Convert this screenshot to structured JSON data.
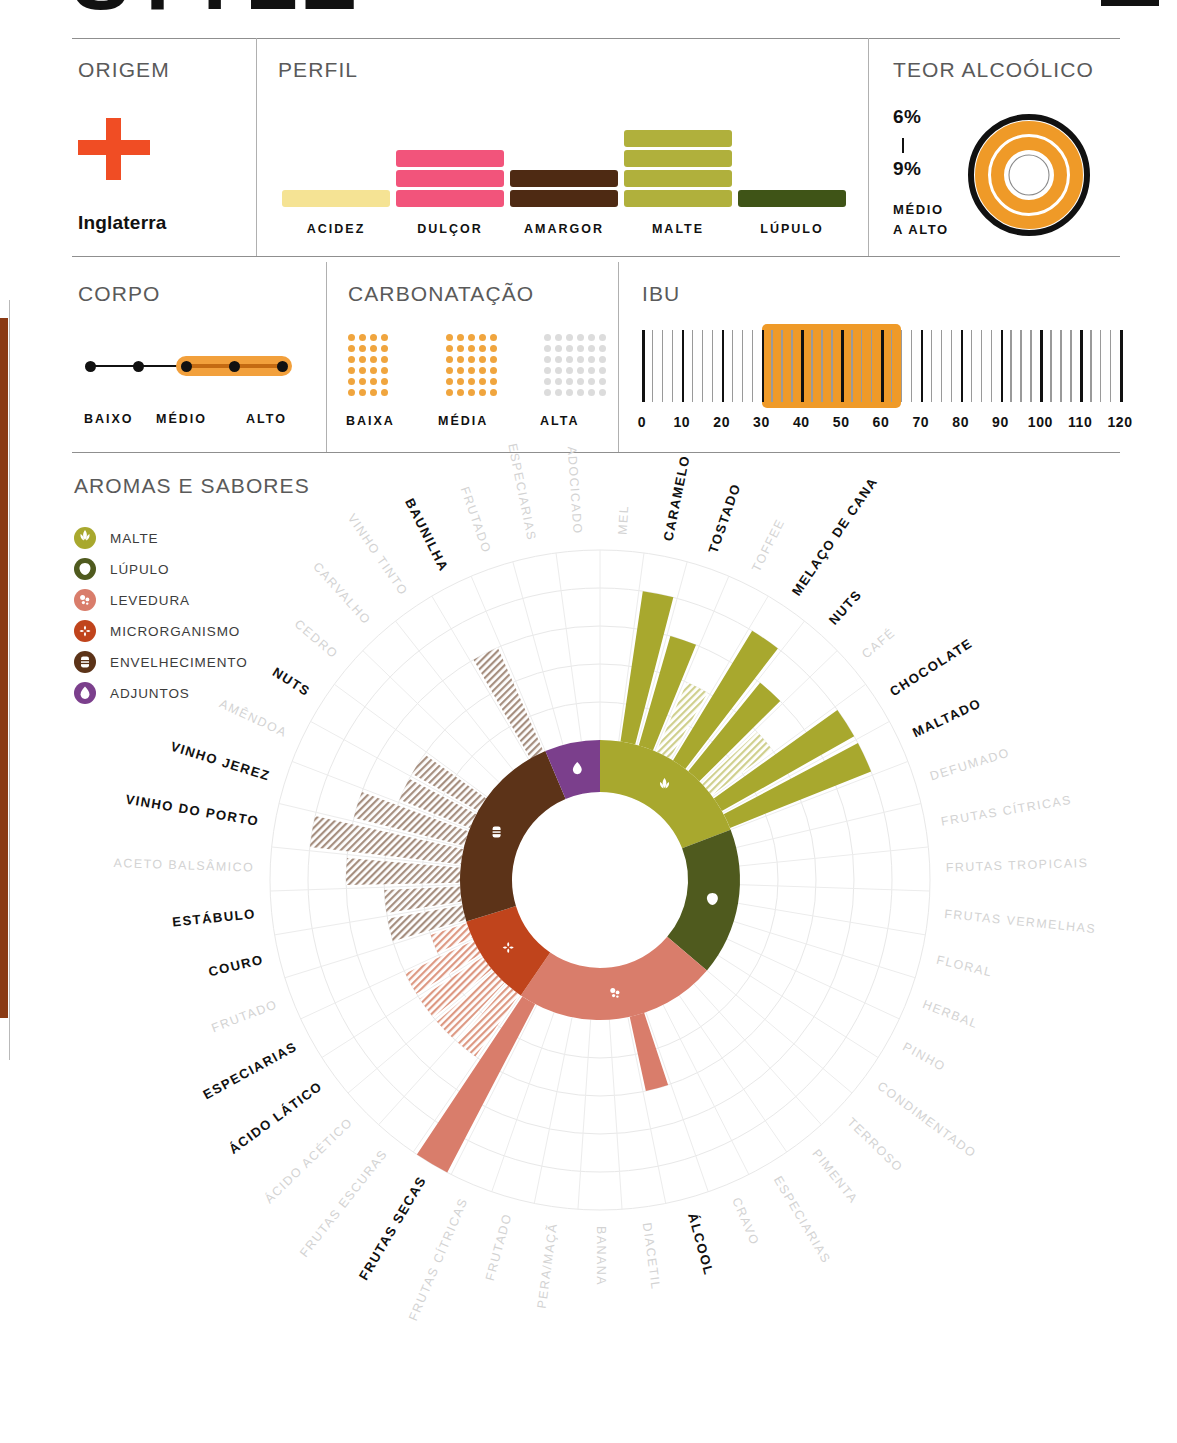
{
  "header": {
    "title_fragment": "STYLE",
    "corner_mark": "block"
  },
  "origem": {
    "heading": "ORIGEM",
    "country": "Inglaterra",
    "flag_icon": "england-cross-flag",
    "flag_color": "#f04d24"
  },
  "perfil": {
    "heading": "PERFIL",
    "bars": [
      {
        "label": "ACIDEZ",
        "value": 1,
        "color": "#f5e394"
      },
      {
        "label": "DULÇOR",
        "value": 3,
        "color": "#f2547b"
      },
      {
        "label": "AMARGOR",
        "value": 2,
        "color": "#4e2a13"
      },
      {
        "label": "MALTE",
        "value": 4,
        "color": "#b0b03c"
      },
      {
        "label": "LÚPULO",
        "value": 1,
        "color": "#3f5417"
      }
    ],
    "max": 4
  },
  "teor": {
    "heading": "TEOR ALCOÓLICO",
    "min": "6%",
    "max": "9%",
    "separator": "|",
    "descriptor_line1": "MÉDIO",
    "descriptor_line2": "A ALTO",
    "ring_color": "#ef9a28",
    "outline_color": "#111111"
  },
  "corpo": {
    "heading": "CORPO",
    "dots": 5,
    "active_from": 3,
    "active_to": 5,
    "labels": [
      "BAIXO",
      "MÉDIO",
      "ALTO"
    ],
    "highlight_color": "#f2a03c"
  },
  "carbonatacao": {
    "heading": "CARBONATAÇÃO",
    "levels": [
      {
        "label": "BAIXA",
        "cols": 4,
        "rows": 6,
        "active": true,
        "color": "#f0a53e"
      },
      {
        "label": "MÉDIA",
        "cols": 5,
        "rows": 6,
        "active": true,
        "color": "#f0a53e"
      },
      {
        "label": "ALTA",
        "cols": 6,
        "rows": 6,
        "active": false,
        "color": "#dcdcdc"
      }
    ]
  },
  "ibu": {
    "heading": "IBU",
    "ticks": [
      "0",
      "10",
      "20",
      "30",
      "40",
      "50",
      "60",
      "70",
      "80",
      "90",
      "100",
      "110",
      "120"
    ],
    "min": 0,
    "max": 120,
    "range_start": 30,
    "range_end": 65,
    "band_color": "#ef9a28"
  },
  "aromas": {
    "heading": "AROMAS E SABORES",
    "legend": [
      {
        "label": "MALTE",
        "color": "#a8a82e",
        "icon": "wheat-icon"
      },
      {
        "label": "LÚPULO",
        "color": "#4f5a1e",
        "icon": "hop-cone-icon"
      },
      {
        "label": "LEVEDURA",
        "color": "#d97d6b",
        "icon": "yeast-bubbles-icon"
      },
      {
        "label": "MICRORGANISMO",
        "color": "#c0441c",
        "icon": "microbe-icon"
      },
      {
        "label": "ENVELHECIMENTO",
        "color": "#5c3318",
        "icon": "barrel-icon"
      },
      {
        "label": "ADJUNTOS",
        "color": "#7b3f8c",
        "icon": "droplet-icon"
      }
    ]
  },
  "chart_data": {
    "type": "radial-bar",
    "title": "AROMAS E SABORES",
    "rings": 5,
    "ring_max": 5,
    "fill_styles": {
      "solid": "strong presence",
      "hatched": "secondary presence",
      "none": "absent"
    },
    "sectors": [
      {
        "name": "MALTE",
        "color": "#a8a82e",
        "icon": "wheat-icon",
        "start_angle": -90,
        "end_angle": 0,
        "spokes": [
          {
            "label": "MEL",
            "value": 0,
            "fill": "none",
            "active": false
          },
          {
            "label": "CARAMELO",
            "value": 4,
            "fill": "solid",
            "active": true
          },
          {
            "label": "TOSTADO",
            "value": 3,
            "fill": "solid",
            "active": true
          },
          {
            "label": "TOFFEE",
            "value": 2,
            "fill": "hatched",
            "active": false
          },
          {
            "label": "MELAÇO DE CANA",
            "value": 4,
            "fill": "solid",
            "active": true
          },
          {
            "label": "NUTS",
            "value": 3,
            "fill": "solid",
            "active": true
          },
          {
            "label": "CAFÉ",
            "value": 2,
            "fill": "hatched",
            "active": false
          },
          {
            "label": "CHOCOLATE",
            "value": 4,
            "fill": "solid",
            "active": true
          },
          {
            "label": "MALTADO",
            "value": 4,
            "fill": "solid",
            "active": true
          }
        ]
      },
      {
        "name": "LÚPULO",
        "color": "#4f5a1e",
        "icon": "hop-cone-icon",
        "start_angle": 0,
        "end_angle": 70,
        "spokes": [
          {
            "label": "DEFUMADO",
            "value": 0,
            "fill": "none",
            "active": false
          },
          {
            "label": "FRUTAS CÍTRICAS",
            "value": 0,
            "fill": "none",
            "active": false
          },
          {
            "label": "FRUTAS TROPICAIS",
            "value": 0,
            "fill": "none",
            "active": false
          },
          {
            "label": "FRUTAS VERMELHAS",
            "value": 0,
            "fill": "none",
            "active": false
          },
          {
            "label": "FLORAL",
            "value": 0,
            "fill": "none",
            "active": false
          },
          {
            "label": "HERBAL",
            "value": 0,
            "fill": "none",
            "active": false
          },
          {
            "label": "PINHO",
            "value": 0,
            "fill": "none",
            "active": false
          },
          {
            "label": "CONDIMENTADO",
            "value": 0,
            "fill": "none",
            "active": false
          }
        ]
      },
      {
        "name": "LEVEDURA",
        "color": "#d97d6b",
        "icon": "yeast-bubbles-icon",
        "start_angle": 70,
        "end_angle": 160,
        "spokes": [
          {
            "label": "TERROSO",
            "value": 0,
            "fill": "none",
            "active": false
          },
          {
            "label": "PIMENTA",
            "value": 0,
            "fill": "none",
            "active": false
          },
          {
            "label": "ESPECIARIAS",
            "value": 0,
            "fill": "none",
            "active": false
          },
          {
            "label": "CRAVO",
            "value": 0,
            "fill": "none",
            "active": false
          },
          {
            "label": "ÁLCOOL",
            "value": 2,
            "fill": "solid",
            "active": true
          },
          {
            "label": "DIACETIL",
            "value": 0,
            "fill": "none",
            "active": false
          },
          {
            "label": "BANANA",
            "value": 0,
            "fill": "none",
            "active": false
          },
          {
            "label": "PERA/MAÇÃ",
            "value": 0,
            "fill": "none",
            "active": false
          },
          {
            "label": "FRUTADO",
            "value": 0,
            "fill": "none",
            "active": false
          },
          {
            "label": "FRUTAS CÍTRICAS",
            "value": 0,
            "fill": "none",
            "active": false
          },
          {
            "label": "FRUTAS SECAS",
            "value": 5,
            "fill": "solid",
            "active": true
          }
        ]
      },
      {
        "name": "MICRORGANISMO",
        "color": "#c0441c",
        "icon": "microbe-icon",
        "start_angle": 160,
        "end_angle": 205,
        "spokes": [
          {
            "label": "FRUTAS ESCURAS",
            "value": 2,
            "fill": "hatched",
            "active": false
          },
          {
            "label": "ÁCIDO ACÉTICO",
            "value": 2,
            "fill": "hatched",
            "active": false
          },
          {
            "label": "ÁCIDO LÁTICO",
            "value": 2,
            "fill": "hatched",
            "active": true
          },
          {
            "label": "ESPECIARIAS",
            "value": 2,
            "fill": "hatched",
            "active": true
          },
          {
            "label": "FRUTADO",
            "value": 1,
            "fill": "hatched",
            "active": false
          }
        ]
      },
      {
        "name": "ENVELHECIMENTO",
        "color": "#5c3318",
        "icon": "barrel-icon",
        "start_angle": 205,
        "end_angle": 260,
        "spokes": [
          {
            "label": "COURO",
            "value": 2,
            "fill": "hatched",
            "active": true
          },
          {
            "label": "ESTÁBULO",
            "value": 2,
            "fill": "hatched",
            "active": true
          },
          {
            "label": "ACETO BALSÂMICO",
            "value": 3,
            "fill": "hatched",
            "active": false
          },
          {
            "label": "VINHO DO PORTO",
            "value": 4,
            "fill": "hatched",
            "active": true
          },
          {
            "label": "VINHO JEREZ",
            "value": 3,
            "fill": "hatched",
            "active": true
          },
          {
            "label": "AMÊNDOA",
            "value": 2,
            "fill": "hatched",
            "active": false
          },
          {
            "label": "NUTS",
            "value": 2,
            "fill": "hatched",
            "active": true
          },
          {
            "label": "CEDRO",
            "value": 0,
            "fill": "none",
            "active": false
          },
          {
            "label": "CARVALHO",
            "value": 0,
            "fill": "none",
            "active": false
          },
          {
            "label": "VINHO TINTO",
            "value": 0,
            "fill": "none",
            "active": false
          },
          {
            "label": "BAUNILHA",
            "value": 3,
            "fill": "hatched",
            "active": true
          }
        ]
      },
      {
        "name": "ADJUNTOS",
        "color": "#7b3f8c",
        "icon": "droplet-icon",
        "start_angle": 260,
        "end_angle": 285,
        "spokes": [
          {
            "label": "FRUTADO",
            "value": 0,
            "fill": "none",
            "active": false
          },
          {
            "label": "ESPECIARIAS",
            "value": 0,
            "fill": "none",
            "active": false
          },
          {
            "label": "ADOCICADO",
            "value": 0,
            "fill": "none",
            "active": false
          }
        ]
      }
    ],
    "outer_labels_clockwise_from_top": [
      "ESPECIARIAS",
      "ADOCICADO",
      "PÃO",
      "BISCOITO",
      "GRÃOS",
      "MEL",
      "CARAMELO",
      "TOSTADO",
      "TOFFEE",
      "MELAÇO DE CANA",
      "NUTS",
      "CAFÉ",
      "CHOCOLATE",
      "MALTADO",
      "DEFUMADO",
      "FRUTAS CÍTRICAS",
      "FRUTAS TROPICAIS",
      "FRUTAS VERMELHAS",
      "FLORAL",
      "HERBAL",
      "PINHO",
      "CONDIMENTADO",
      "TERROSO",
      "PIMENTA",
      "ESPECIARIAS",
      "CRAVO",
      "ÁLCOOL",
      "DIACETIL",
      "BANANA",
      "PERA/MAÇÃ",
      "FRUTADO",
      "FRUTAS CÍTRICAS",
      "FRUTAS SECAS",
      "FRUTAS ESCURAS",
      "ÁCIDO ACÉTICO",
      "ÁCIDO LÁTICO",
      "ESPECIARIAS",
      "FRUTADO",
      "COURO",
      "ESTÁBULO",
      "ACETO BALSÂMICO",
      "VINHO DO PORTO",
      "VINHO JEREZ",
      "AMÊNDOA",
      "NUTS",
      "CEDRO",
      "CARVALHO",
      "VINHO TINTO",
      "BAUNILHA",
      "FRUTADO"
    ]
  }
}
